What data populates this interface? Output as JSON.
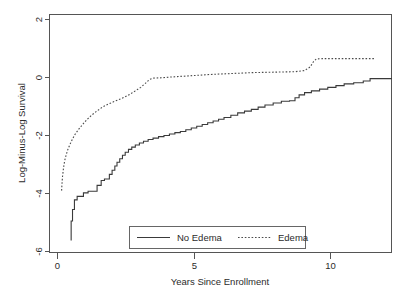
{
  "chart_data": {
    "type": "line",
    "title": "",
    "xlabel": "Years Since Enrollment",
    "ylabel": "Log-Minus-Log Survival",
    "xlim": [
      -0.45,
      12.3
    ],
    "ylim": [
      -6.45,
      2.35
    ],
    "xticks": [
      0,
      5,
      10
    ],
    "xticklabels": [
      "0",
      "5",
      "10"
    ],
    "yticks": [
      2,
      0,
      -2,
      -4,
      -6
    ],
    "yticklabels": [
      "2",
      "0",
      "-2",
      "-4",
      "-6"
    ],
    "grid": false,
    "legend_position": "lower center",
    "series": [
      {
        "name": "No Edema",
        "style": "solid",
        "color": "#3a3a3a",
        "points": [
          [
            0.5,
            -5.62
          ],
          [
            0.5,
            -4.95
          ],
          [
            0.55,
            -4.95
          ],
          [
            0.55,
            -4.55
          ],
          [
            0.62,
            -4.55
          ],
          [
            0.62,
            -4.22
          ],
          [
            0.72,
            -4.22
          ],
          [
            0.72,
            -4.1
          ],
          [
            0.95,
            -4.1
          ],
          [
            0.95,
            -3.98
          ],
          [
            1.12,
            -3.98
          ],
          [
            1.12,
            -3.92
          ],
          [
            1.45,
            -3.92
          ],
          [
            1.45,
            -3.72
          ],
          [
            1.6,
            -3.72
          ],
          [
            1.6,
            -3.55
          ],
          [
            1.72,
            -3.55
          ],
          [
            1.72,
            -3.5
          ],
          [
            1.9,
            -3.5
          ],
          [
            1.9,
            -3.34
          ],
          [
            2.0,
            -3.34
          ],
          [
            2.0,
            -3.2
          ],
          [
            2.1,
            -3.2
          ],
          [
            2.1,
            -3.05
          ],
          [
            2.18,
            -3.05
          ],
          [
            2.18,
            -2.92
          ],
          [
            2.28,
            -2.92
          ],
          [
            2.28,
            -2.8
          ],
          [
            2.38,
            -2.8
          ],
          [
            2.38,
            -2.68
          ],
          [
            2.48,
            -2.68
          ],
          [
            2.48,
            -2.58
          ],
          [
            2.6,
            -2.58
          ],
          [
            2.6,
            -2.48
          ],
          [
            2.72,
            -2.48
          ],
          [
            2.72,
            -2.4
          ],
          [
            2.85,
            -2.4
          ],
          [
            2.85,
            -2.33
          ],
          [
            3.0,
            -2.33
          ],
          [
            3.0,
            -2.26
          ],
          [
            3.15,
            -2.26
          ],
          [
            3.15,
            -2.2
          ],
          [
            3.32,
            -2.2
          ],
          [
            3.32,
            -2.14
          ],
          [
            3.5,
            -2.14
          ],
          [
            3.5,
            -2.09
          ],
          [
            3.7,
            -2.09
          ],
          [
            3.7,
            -2.04
          ],
          [
            3.9,
            -2.04
          ],
          [
            3.9,
            -2.0
          ],
          [
            4.1,
            -2.0
          ],
          [
            4.1,
            -1.95
          ],
          [
            4.3,
            -1.95
          ],
          [
            4.3,
            -1.9
          ],
          [
            4.5,
            -1.9
          ],
          [
            4.5,
            -1.86
          ],
          [
            4.7,
            -1.86
          ],
          [
            4.7,
            -1.8
          ],
          [
            4.9,
            -1.8
          ],
          [
            4.9,
            -1.74
          ],
          [
            5.1,
            -1.74
          ],
          [
            5.1,
            -1.68
          ],
          [
            5.3,
            -1.68
          ],
          [
            5.3,
            -1.62
          ],
          [
            5.5,
            -1.62
          ],
          [
            5.5,
            -1.56
          ],
          [
            5.7,
            -1.56
          ],
          [
            5.7,
            -1.5
          ],
          [
            5.9,
            -1.5
          ],
          [
            5.9,
            -1.44
          ],
          [
            6.1,
            -1.44
          ],
          [
            6.1,
            -1.38
          ],
          [
            6.35,
            -1.38
          ],
          [
            6.35,
            -1.3
          ],
          [
            6.6,
            -1.3
          ],
          [
            6.6,
            -1.22
          ],
          [
            6.85,
            -1.22
          ],
          [
            6.85,
            -1.16
          ],
          [
            7.1,
            -1.16
          ],
          [
            7.1,
            -1.1
          ],
          [
            7.35,
            -1.1
          ],
          [
            7.35,
            -1.02
          ],
          [
            7.6,
            -1.02
          ],
          [
            7.6,
            -0.95
          ],
          [
            7.9,
            -0.95
          ],
          [
            7.9,
            -0.88
          ],
          [
            8.2,
            -0.88
          ],
          [
            8.2,
            -0.82
          ],
          [
            8.5,
            -0.82
          ],
          [
            8.5,
            -0.8
          ],
          [
            8.7,
            -0.8
          ],
          [
            8.7,
            -0.7
          ],
          [
            8.85,
            -0.7
          ],
          [
            8.85,
            -0.6
          ],
          [
            9.05,
            -0.6
          ],
          [
            9.05,
            -0.52
          ],
          [
            9.3,
            -0.52
          ],
          [
            9.3,
            -0.46
          ],
          [
            9.6,
            -0.46
          ],
          [
            9.6,
            -0.4
          ],
          [
            9.9,
            -0.4
          ],
          [
            9.9,
            -0.34
          ],
          [
            10.2,
            -0.34
          ],
          [
            10.2,
            -0.28
          ],
          [
            10.5,
            -0.28
          ],
          [
            10.5,
            -0.22
          ],
          [
            10.85,
            -0.22
          ],
          [
            10.85,
            -0.18
          ],
          [
            11.2,
            -0.18
          ],
          [
            11.2,
            -0.12
          ],
          [
            11.45,
            -0.12
          ],
          [
            11.45,
            -0.04
          ],
          [
            12.25,
            -0.04
          ]
        ]
      },
      {
        "name": "Edema",
        "style": "dotted",
        "color": "#4a4a4a",
        "points": [
          [
            0.15,
            -3.9
          ],
          [
            0.18,
            -3.45
          ],
          [
            0.22,
            -3.12
          ],
          [
            0.26,
            -2.88
          ],
          [
            0.32,
            -2.66
          ],
          [
            0.38,
            -2.48
          ],
          [
            0.46,
            -2.3
          ],
          [
            0.55,
            -2.12
          ],
          [
            0.65,
            -1.95
          ],
          [
            0.78,
            -1.78
          ],
          [
            0.92,
            -1.62
          ],
          [
            1.08,
            -1.45
          ],
          [
            1.25,
            -1.3
          ],
          [
            1.45,
            -1.15
          ],
          [
            1.65,
            -1.02
          ],
          [
            1.85,
            -0.92
          ],
          [
            2.05,
            -0.84
          ],
          [
            2.25,
            -0.76
          ],
          [
            2.45,
            -0.68
          ],
          [
            2.65,
            -0.58
          ],
          [
            2.85,
            -0.46
          ],
          [
            3.05,
            -0.34
          ],
          [
            3.22,
            -0.2
          ],
          [
            3.38,
            -0.06
          ],
          [
            3.52,
            -0.02
          ],
          [
            3.8,
            -0.01
          ],
          [
            4.2,
            0.02
          ],
          [
            4.7,
            0.05
          ],
          [
            5.2,
            0.08
          ],
          [
            5.7,
            0.11
          ],
          [
            6.2,
            0.13
          ],
          [
            6.7,
            0.15
          ],
          [
            7.2,
            0.17
          ],
          [
            7.7,
            0.18
          ],
          [
            8.2,
            0.19
          ],
          [
            8.7,
            0.2
          ],
          [
            9.05,
            0.24
          ],
          [
            9.25,
            0.36
          ],
          [
            9.38,
            0.55
          ],
          [
            9.48,
            0.64
          ],
          [
            9.7,
            0.65
          ],
          [
            10.5,
            0.65
          ],
          [
            11.6,
            0.65
          ]
        ]
      }
    ],
    "legend": [
      {
        "label": "No Edema",
        "style": "solid"
      },
      {
        "label": "Edema",
        "style": "dotted"
      }
    ]
  }
}
